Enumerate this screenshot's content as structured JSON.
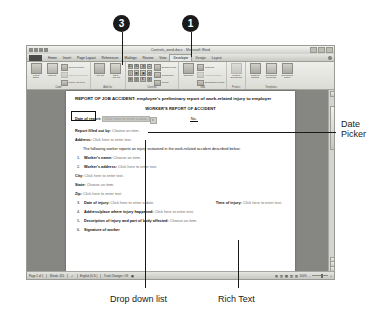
{
  "callouts": [
    {
      "number": "3",
      "x": 113,
      "y": 15
    },
    {
      "number": "1",
      "x": 182,
      "y": 15
    }
  ],
  "annotations": [
    {
      "name": "date-picker",
      "lines": [
        "Date",
        "Picker"
      ],
      "x": 345,
      "y": 124
    },
    {
      "name": "drop-down-list",
      "lines": [
        "Drop down list"
      ],
      "x": 126,
      "y": 300
    },
    {
      "name": "rich-text",
      "lines": [
        "Rich Text"
      ],
      "x": 232,
      "y": 300
    }
  ],
  "window": {
    "title": "Controls_word.docx - Microsoft Word",
    "quick_access": [
      "save-icon",
      "undo-icon",
      "redo-icon",
      "customize-icon"
    ],
    "window_buttons": [
      "minimize-button",
      "restore-button",
      "close-button"
    ],
    "office_button": "Office Button",
    "help_button": "help-icon"
  },
  "tabs": [
    {
      "label": "Home",
      "active": false,
      "contextual": false
    },
    {
      "label": "Insert",
      "active": false,
      "contextual": false
    },
    {
      "label": "Page Layout",
      "active": false,
      "contextual": false
    },
    {
      "label": "References",
      "active": false,
      "contextual": false
    },
    {
      "label": "Mailings",
      "active": false,
      "contextual": false
    },
    {
      "label": "Review",
      "active": false,
      "contextual": false
    },
    {
      "label": "View",
      "active": false,
      "contextual": false
    },
    {
      "label": "Developer",
      "active": true,
      "contextual": false
    },
    {
      "label": "Design",
      "active": false,
      "contextual": true
    },
    {
      "label": "Layout",
      "active": false,
      "contextual": true
    }
  ],
  "ribbon": {
    "groups": [
      {
        "name": "Code",
        "big_buttons": [
          {
            "label1": "Visual",
            "label2": "Basic",
            "icon": "visual-basic-icon"
          },
          {
            "label1": "Macros",
            "label2": "",
            "icon": "macros-icon"
          }
        ],
        "small_buttons": [
          {
            "label": "Record Macro",
            "icon": "record-macro-icon",
            "disabled": false
          },
          {
            "label": "Pause Recording",
            "icon": "pause-recording-icon",
            "disabled": true
          },
          {
            "label": "Macro Security",
            "icon": "macro-security-icon",
            "disabled": false
          }
        ]
      },
      {
        "name": "Add-Ins",
        "big_buttons": [
          {
            "label1": "Add-Ins",
            "label2": "",
            "icon": "add-ins-icon"
          },
          {
            "label1": "COM",
            "label2": "Add-Ins",
            "icon": "com-add-ins-icon"
          }
        ],
        "small_buttons": []
      },
      {
        "name": "Controls",
        "grid": [
          "Aa",
          "Aa",
          "▤",
          "☑",
          "☰",
          "▦",
          "▣",
          "▧",
          "▤",
          "▥",
          "A↓",
          "▨"
        ],
        "small_buttons": [
          {
            "label": "Design Mode",
            "icon": "design-mode-icon",
            "disabled": false
          },
          {
            "label": "Properties",
            "icon": "properties-icon",
            "disabled": false
          },
          {
            "label": "Group",
            "icon": "group-icon",
            "disabled": false
          }
        ]
      },
      {
        "name": "XML",
        "big_buttons": [
          {
            "label1": "Structure",
            "label2": "",
            "icon": "structure-icon"
          }
        ],
        "small_buttons": [
          {
            "label": "Schema",
            "icon": "schema-icon",
            "disabled": false
          },
          {
            "label": "Transformation",
            "icon": "transformation-icon",
            "disabled": true
          },
          {
            "label": "Expansion Packs",
            "icon": "expansion-packs-icon",
            "disabled": false
          }
        ]
      },
      {
        "name": "Protect",
        "big_buttons": [
          {
            "label1": "Protect",
            "label2": "Document",
            "icon": "protect-document-icon"
          }
        ],
        "small_buttons": []
      },
      {
        "name": "Templates",
        "big_buttons": [
          {
            "label1": "Restrict",
            "label2": "Editing",
            "icon": "restrict-editing-icon"
          },
          {
            "label1": "Document",
            "label2": "Template",
            "icon": "document-template-icon"
          },
          {
            "label1": "Document",
            "label2": "Panel",
            "icon": "document-panel-icon"
          }
        ],
        "small_buttons": []
      }
    ]
  },
  "document": {
    "title": "REPORT OF JOB ACCIDENT: employee's preliminary report of work-related injury to employer",
    "subtitle": "WORKER'S REPORT OF ACCIDENT",
    "date_of_report_label": "Date of report:",
    "date_of_report_value": "Click here to enter a date.",
    "no_label": "No.",
    "report_filled_label": "Report filled out by:",
    "report_filled_value": "Choose an item.",
    "address_label": "Address:",
    "address_value": "Click here to enter text.",
    "intro": "The following worker reports an injury sustained in the work-related accident described below:",
    "items": [
      {
        "num": "1.",
        "label": "Worker's name:",
        "value": "Choose an item."
      },
      {
        "num": "2.",
        "label": "Worker's address:",
        "value": "Click here to enter text."
      }
    ],
    "city_label": "City:",
    "city_value": "Click here to enter text.",
    "state_label": "State:",
    "state_value": "Choose an item.",
    "zip_label": "Zip:",
    "zip_value": "Click here to enter text.",
    "item3_num": "3.",
    "item3_label": "Date of injury:",
    "item3_value": "Click here to enter a date.",
    "time_label": "Time of injury:",
    "time_value": "Click here to enter text.",
    "item4_num": "4.",
    "item4_label": "Address/place where injury happened:",
    "item4_value": "Click here to enter text.",
    "item5_num": "5.",
    "item5_label": "Description of injury and part of body affected:",
    "item5_value": "Choose an item.",
    "item6_num": "6.",
    "item6_label": "Signature of worker"
  },
  "status": {
    "page": "Page 1 of 1",
    "words": "Words: 415",
    "language": "English (U.S.)",
    "track_changes": "Track Changes: Off",
    "zoom": "100%",
    "proof_icon": "proofing-icon",
    "view_icons": [
      "print-layout-icon",
      "full-screen-icon",
      "web-layout-icon",
      "outline-icon",
      "draft-icon"
    ]
  }
}
